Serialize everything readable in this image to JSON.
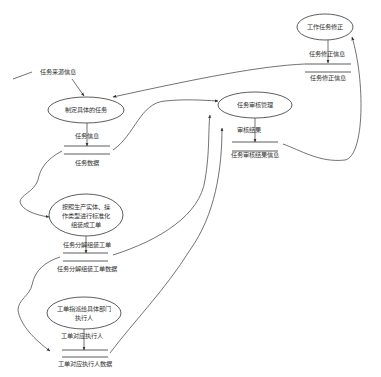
{
  "diagram": {
    "type": "data-flow-diagram",
    "processes": [
      {
        "id": "p_revise",
        "label": "工作任务修正"
      },
      {
        "id": "p_define",
        "label": "制定具体的任务"
      },
      {
        "id": "p_review",
        "label": "任务审核管理"
      },
      {
        "id": "p_assemble",
        "label_lines": [
          "按照生产实体、操",
          "作类型进行标准化",
          "组装成工单"
        ]
      },
      {
        "id": "p_assign",
        "label_lines": [
          "工单指派给具体部门",
          "执行人"
        ]
      }
    ],
    "flows": [
      {
        "id": "f_source",
        "label": "任务来源信息"
      },
      {
        "id": "f_revise_info",
        "label": "任务修正信息"
      },
      {
        "id": "f_task_info",
        "label": "任务信息"
      },
      {
        "id": "f_review_result",
        "label": "审核结果"
      },
      {
        "id": "f_decompose",
        "label": "任务分解组装工单"
      },
      {
        "id": "f_executor",
        "label": "工单对应执行人"
      }
    ],
    "stores": [
      {
        "id": "s_revise",
        "label": "任务修正信息"
      },
      {
        "id": "s_task",
        "label": "任务数据"
      },
      {
        "id": "s_review",
        "label": "任务审核结果信息"
      },
      {
        "id": "s_workorder",
        "label": "任务分解组装工单数据"
      },
      {
        "id": "s_executor",
        "label": "工单对应执行人数据"
      }
    ]
  }
}
